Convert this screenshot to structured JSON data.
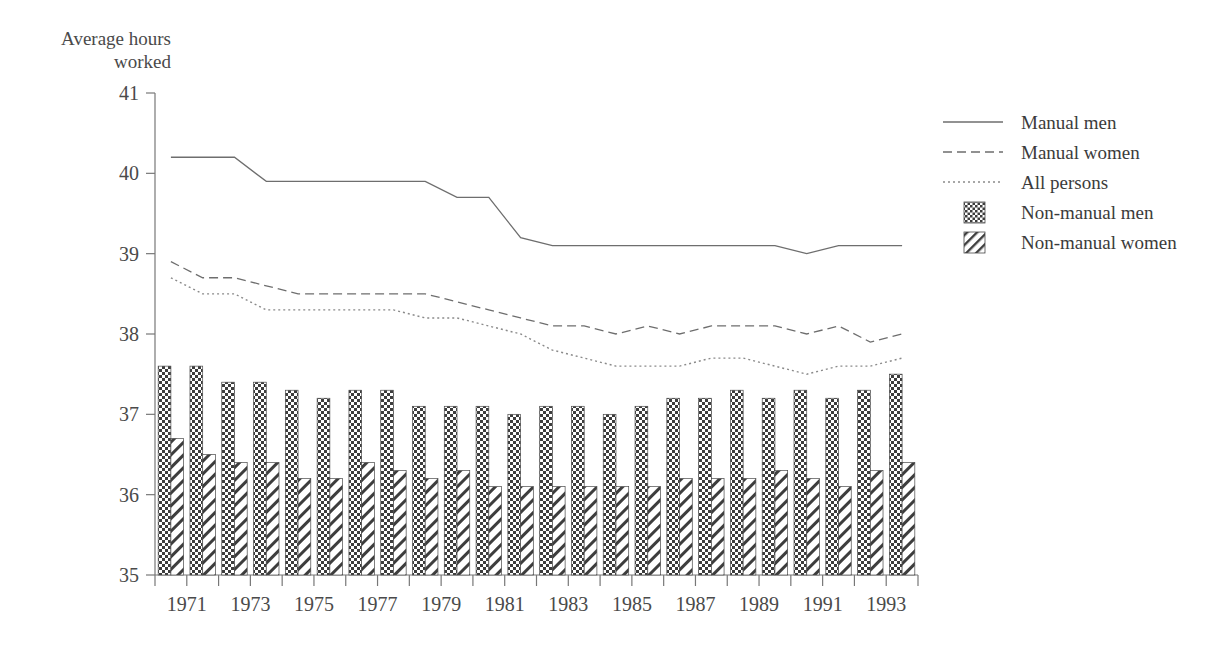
{
  "chart_data": {
    "type": "bar",
    "title": "",
    "ylabel_line1": "Average hours",
    "ylabel_line2": "worked",
    "xlabel": "",
    "ylim": [
      35,
      41
    ],
    "yticks": [
      35,
      36,
      37,
      38,
      39,
      40,
      41
    ],
    "grid": false,
    "legend_position": "right",
    "x": [
      1971,
      1972,
      1973,
      1974,
      1975,
      1976,
      1977,
      1978,
      1979,
      1980,
      1981,
      1982,
      1983,
      1984,
      1985,
      1986,
      1987,
      1988,
      1989,
      1990,
      1991,
      1992,
      1993,
      1994
    ],
    "xtick_labels": [
      "1971",
      "1973",
      "1975",
      "1977",
      "1979",
      "1981",
      "1983",
      "1985",
      "1987",
      "1989",
      "1991",
      "1993"
    ],
    "xtick_years": [
      1971,
      1973,
      1975,
      1977,
      1979,
      1981,
      1983,
      1985,
      1987,
      1989,
      1991,
      1993
    ],
    "series": [
      {
        "name": "Manual men",
        "style": "solid",
        "render": "line",
        "values": [
          40.2,
          40.2,
          40.2,
          39.9,
          39.9,
          39.9,
          39.9,
          39.9,
          39.9,
          39.7,
          39.7,
          39.2,
          39.1,
          39.1,
          39.1,
          39.1,
          39.1,
          39.1,
          39.1,
          39.1,
          39.0,
          39.1,
          39.1,
          39.1
        ]
      },
      {
        "name": "Manual women",
        "style": "dashed",
        "render": "line",
        "values": [
          38.9,
          38.7,
          38.7,
          38.6,
          38.5,
          38.5,
          38.5,
          38.5,
          38.5,
          38.4,
          38.3,
          38.2,
          38.1,
          38.1,
          38.0,
          38.1,
          38.0,
          38.1,
          38.1,
          38.1,
          38.0,
          38.1,
          37.9,
          38.0
        ]
      },
      {
        "name": "All persons",
        "style": "dotted",
        "render": "line",
        "values": [
          38.7,
          38.5,
          38.5,
          38.3,
          38.3,
          38.3,
          38.3,
          38.3,
          38.2,
          38.2,
          38.1,
          38.0,
          37.8,
          37.7,
          37.6,
          37.6,
          37.6,
          37.7,
          37.7,
          37.6,
          37.5,
          37.6,
          37.6,
          37.7
        ]
      },
      {
        "name": "Non-manual men",
        "style": "checker",
        "render": "bar",
        "values": [
          37.6,
          37.6,
          37.4,
          37.4,
          37.3,
          37.2,
          37.3,
          37.3,
          37.1,
          37.1,
          37.1,
          37.0,
          37.1,
          37.1,
          37.0,
          37.1,
          37.2,
          37.2,
          37.3,
          37.2,
          37.3,
          37.2,
          37.3,
          37.5
        ]
      },
      {
        "name": "Non-manual women",
        "style": "hatch",
        "render": "bar",
        "values": [
          36.7,
          36.5,
          36.4,
          36.4,
          36.2,
          36.2,
          36.4,
          36.3,
          36.2,
          36.3,
          36.1,
          36.1,
          36.1,
          36.1,
          36.1,
          36.1,
          36.2,
          36.2,
          36.2,
          36.3,
          36.2,
          36.1,
          36.3,
          36.4
        ]
      }
    ]
  },
  "legend": {
    "items": [
      {
        "label": "Manual men",
        "swatch": "solid-line-swatch"
      },
      {
        "label": "Manual women",
        "swatch": "dashed-line-swatch"
      },
      {
        "label": "All persons",
        "swatch": "dotted-line-swatch"
      },
      {
        "label": "Non-manual men",
        "swatch": "checker-box-swatch"
      },
      {
        "label": "Non-manual women",
        "swatch": "hatch-box-swatch"
      }
    ]
  },
  "colors": {
    "axis": "#777777",
    "line": "#6e6e6e",
    "dotted": "#8a8a8a",
    "text": "#4a4a4a",
    "bar_stroke": "#4a4a4a",
    "background": "#ffffff"
  }
}
